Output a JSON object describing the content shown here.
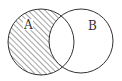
{
  "diagram": {
    "type": "venn",
    "sets": [
      {
        "label": "A",
        "cx": 41,
        "cy": 42,
        "r": 33,
        "shaded": "A minus B (hatched)"
      },
      {
        "label": "B",
        "cx": 81,
        "cy": 41,
        "r": 32,
        "shaded": "none"
      }
    ],
    "shaded_region": "A \\ B",
    "colors": {
      "stroke": "#333333",
      "hatch": "#333333",
      "background": "#ffffff"
    }
  }
}
